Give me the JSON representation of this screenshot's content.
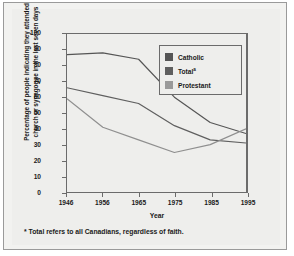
{
  "chart_data": {
    "type": "line",
    "title": "",
    "xlabel": "Year",
    "ylabel": "Percentage of people indicating they attended church or synagogue in the last seven days",
    "ylabel_lines": [
      "Percentage of people indicating they attended",
      "church or synagogue in the last seven days"
    ],
    "categories": [
      "1946",
      "1956",
      "1965",
      "1975",
      "1985",
      "1995"
    ],
    "x": [
      1946,
      1956,
      1965,
      1975,
      1985,
      1995
    ],
    "ylim": [
      0,
      100
    ],
    "xlim": [
      1946,
      1995
    ],
    "yticks": [
      0,
      10,
      20,
      30,
      40,
      50,
      60,
      70,
      80,
      90,
      100
    ],
    "ytick_labels": [
      "0",
      "10",
      "20",
      "30",
      "40",
      "50",
      "60",
      "70",
      "80",
      "90",
      "100"
    ],
    "grid": false,
    "legend_position": "upper right",
    "series": [
      {
        "name": "Catholic",
        "values": [
          87,
          88,
          84,
          60,
          44,
          37
        ],
        "color": "#555555"
      },
      {
        "name": "Total",
        "values": [
          66,
          61,
          56,
          42,
          33,
          31
        ],
        "color": "#5f5f5f"
      },
      {
        "name": "Protestant",
        "values": [
          59,
          41,
          33,
          25,
          30,
          40
        ],
        "color": "#8f8f8f"
      }
    ],
    "footnote": "Total refers to all Canadians, regardless of faith.",
    "footnote_marker": "*",
    "legend": [
      {
        "label": "Catholic",
        "superscript": "",
        "color": "#555555"
      },
      {
        "label": "Total",
        "superscript": "a",
        "color": "#5f5f5f"
      },
      {
        "label": "Protestant",
        "superscript": "",
        "color": "#9a9a9a"
      }
    ],
    "colors": {
      "catholic": "#555555",
      "total": "#5f5f5f",
      "protestant": "#8f8f8f",
      "axis": "#6b6b6b",
      "background": "#eeeeec",
      "frame": "#9a9a9a"
    }
  }
}
